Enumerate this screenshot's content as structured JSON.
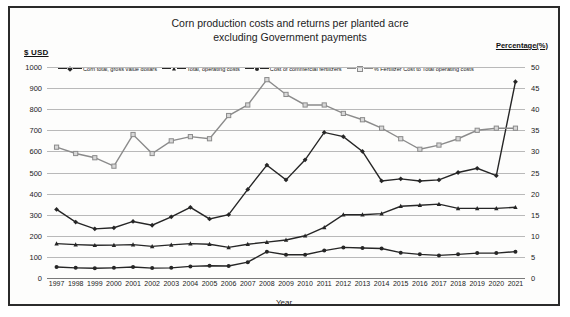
{
  "chart_data": {
    "type": "line",
    "title": "Corn production costs and returns per planted acre excluding Government payments",
    "title_line1": "Corn production costs and returns per planted acre",
    "title_line2": "excluding Government payments",
    "xlabel": "Year",
    "ylabel_left": "$ USD",
    "ylabel_right": "Percentage(%)",
    "ylim_left": [
      0,
      1000
    ],
    "ylim_right": [
      0,
      50
    ],
    "yticks_left": [
      1000,
      900,
      800,
      700,
      600,
      500,
      400,
      300,
      200,
      100,
      0
    ],
    "yticks_right": [
      50,
      45,
      40,
      35,
      30,
      25,
      20,
      15,
      10,
      5,
      0
    ],
    "grid": true,
    "legend_position": "top",
    "categories": [
      1997,
      1998,
      1999,
      2000,
      2001,
      2002,
      2003,
      2004,
      2005,
      2006,
      2007,
      2008,
      2009,
      2010,
      2011,
      2012,
      2013,
      2014,
      2015,
      2016,
      2017,
      2018,
      2019,
      2020,
      2021
    ],
    "series": [
      {
        "name": "Corn total, gross value dollars",
        "axis": "left",
        "color": "#262626",
        "marker": "diamond",
        "values": [
          325,
          265,
          233,
          238,
          268,
          250,
          290,
          335,
          280,
          300,
          420,
          535,
          465,
          560,
          690,
          670,
          600,
          460,
          470,
          460,
          465,
          500,
          520,
          485,
          930
        ]
      },
      {
        "name": "Total, operating costs",
        "axis": "left",
        "color": "#262626",
        "marker": "triangle",
        "values": [
          163,
          158,
          155,
          156,
          158,
          150,
          157,
          163,
          160,
          145,
          160,
          170,
          180,
          200,
          240,
          300,
          300,
          305,
          340,
          345,
          350,
          330,
          330,
          330,
          335
        ]
      },
      {
        "name": "Cost of commercial fertilizers",
        "axis": "left",
        "color": "#262626",
        "marker": "circle",
        "values": [
          52,
          48,
          46,
          48,
          52,
          47,
          48,
          55,
          58,
          57,
          75,
          125,
          110,
          110,
          130,
          145,
          142,
          140,
          120,
          112,
          107,
          112,
          118,
          118,
          125
        ]
      },
      {
        "name": "% Fertilizer Cost to Total operating costs",
        "axis": "right",
        "color": "#8b8b8b",
        "marker": "square",
        "values": [
          31.0,
          29.5,
          28.5,
          26.5,
          34.0,
          29.5,
          32.5,
          33.5,
          33.0,
          38.5,
          41.0,
          47.0,
          43.5,
          41.0,
          41.0,
          39.0,
          37.5,
          35.5,
          33.0,
          30.5,
          31.5,
          33.0,
          35.0,
          35.5,
          35.5
        ]
      }
    ]
  },
  "legend": {
    "items": [
      {
        "label": "Corn total, gross value dollars"
      },
      {
        "label": "Total, operating costs"
      },
      {
        "label": "Cost of commercial fertilizers"
      },
      {
        "label": "% Fertilizer Cost to Total operating costs"
      }
    ]
  }
}
